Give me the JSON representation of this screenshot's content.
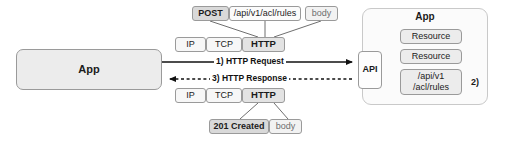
{
  "diagram": {
    "colors": {
      "stroke": "#9a9a9a",
      "line": "#111111",
      "app_fill": "#ececec",
      "cell_fill": "#f7f7f7",
      "strong_fill": "#e3e3e3",
      "container_fill": "#fbfbfb"
    }
  },
  "client": {
    "app_label": "App"
  },
  "request": {
    "header": {
      "method": "POST",
      "path": "/api/v1/acl/rules",
      "body": "body"
    },
    "stack": {
      "ip": "IP",
      "tcp": "TCP",
      "http": "HTTP"
    },
    "flow_label": "1) HTTP Request"
  },
  "response": {
    "stack": {
      "ip": "IP",
      "tcp": "TCP",
      "http": "HTTP"
    },
    "detail": {
      "status": "201 Created",
      "body": "body"
    },
    "flow_label": "3) HTTP Response"
  },
  "server": {
    "gateway_label": "API",
    "app_label": "App",
    "resources": [
      {
        "label": "Resource"
      },
      {
        "label": "Resource"
      }
    ],
    "endpoint": {
      "line1": "/api/v1",
      "line2": "/acl/rules"
    },
    "step_label": "2)"
  }
}
